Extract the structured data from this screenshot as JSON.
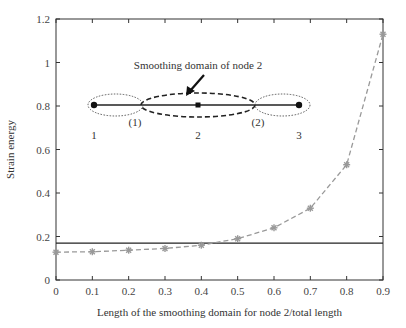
{
  "chart_data": {
    "type": "line",
    "title": "",
    "xlabel": "Length of the smoothing domain for node 2/total length",
    "ylabel": "Strain energy",
    "xlim": [
      0,
      0.9
    ],
    "ylim": [
      0,
      1.2
    ],
    "xticks": [
      "0",
      "0.1",
      "0.2",
      "0.3",
      "0.4",
      "0.5",
      "0.6",
      "0.7",
      "0.8",
      "0.9"
    ],
    "yticks": [
      "0",
      "0.2",
      "0.4",
      "0.6",
      "0.8",
      "1",
      "1.2"
    ],
    "grid": false,
    "series": [
      {
        "name": "Smoothed strain energy",
        "style": "dashed-gray-star-markers",
        "x": [
          0,
          0.1,
          0.2,
          0.3,
          0.4,
          0.5,
          0.6,
          0.7,
          0.8,
          0.9
        ],
        "values": [
          0.128,
          0.13,
          0.137,
          0.145,
          0.16,
          0.19,
          0.24,
          0.33,
          0.53,
          1.13
        ]
      },
      {
        "name": "Exact/reference strain energy",
        "style": "solid-black",
        "x": [
          0,
          0.9
        ],
        "values": [
          0.17,
          0.17
        ]
      }
    ],
    "annotations": {
      "inset_title": "Smoothing domain of node 2",
      "node_labels": [
        "1",
        "2",
        "3"
      ],
      "boundary_labels": [
        "(1)",
        "(2)"
      ]
    }
  }
}
